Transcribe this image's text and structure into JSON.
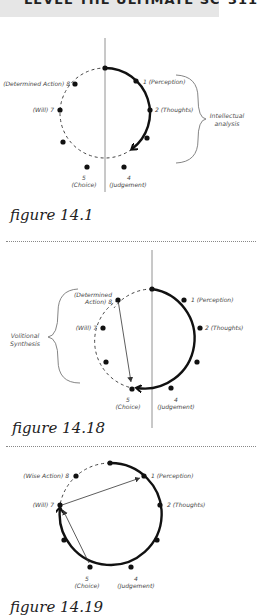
{
  "header": {
    "title": "LEVEL THE ULTIMATE SCIENCE",
    "page_number": "311"
  },
  "figures": [
    {
      "caption": "figure 14.1",
      "labels": {
        "p1": "1 (Perception)",
        "p2": "2 (Thoughts)",
        "p4_num": "4",
        "p4": "(Judgement)",
        "p5_num": "5",
        "p5": "(Choice)",
        "p7": "(Will) 7",
        "p8": "(Determined Action) 8"
      },
      "brace_label_line1": "Intellectual",
      "brace_label_line2": "analysis"
    },
    {
      "caption": "figure 14.18",
      "labels": {
        "p1": "1 (Perception)",
        "p2": "2 (Thoughts)",
        "p4_num": "4",
        "p4": "(Judgement)",
        "p5_num": "5",
        "p5": "(Choice)",
        "p7": "(Will) 7",
        "p8_line1": "(Determined",
        "p8_line2": "Action) 8"
      },
      "brace_label_line1": "Volitional",
      "brace_label_line2": "Synthesis"
    },
    {
      "caption": "figure 14.19",
      "labels": {
        "p1": "1 (Perception)",
        "p2": "2 (Thoughts)",
        "p4_num": "4",
        "p4": "(Judgement)",
        "p5_num": "5",
        "p5": "(Choice)",
        "p7": "(Will) 7",
        "p8": "(Wise Action) 8"
      }
    }
  ]
}
